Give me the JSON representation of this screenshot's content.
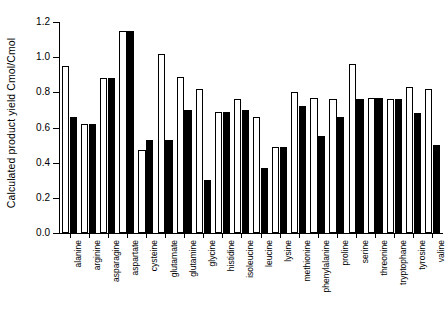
{
  "chart_data": {
    "type": "bar",
    "title": "",
    "xlabel": "",
    "ylabel": "Calculated product yield Cmol/Cmol",
    "ylim": [
      0.0,
      1.2
    ],
    "ytick_labels": [
      "0.0",
      "0.2",
      "0.4",
      "0.6",
      "0.8",
      "1.0",
      "1.2"
    ],
    "ytick_values": [
      0.0,
      0.2,
      0.4,
      0.6,
      0.8,
      1.0,
      1.2
    ],
    "grid": false,
    "legend": "none",
    "categories": [
      "alanine",
      "arginine",
      "asparagine",
      "aspartate",
      "cysteine",
      "glutamate",
      "glutamine",
      "glycine",
      "histidine",
      "isoleucine",
      "leucine",
      "lysine",
      "methionine",
      "phenylalanine",
      "proline",
      "serine",
      "threonine",
      "tryptophane",
      "tyrosine",
      "valine"
    ],
    "series": [
      {
        "name": "open",
        "style": "white-filled-black-outline",
        "values": [
          0.95,
          0.62,
          0.88,
          1.15,
          0.47,
          1.02,
          0.89,
          0.82,
          0.69,
          0.76,
          0.66,
          0.49,
          0.8,
          0.77,
          0.76,
          0.96,
          0.77,
          0.76,
          0.83,
          0.82
        ]
      },
      {
        "name": "filled",
        "style": "black",
        "values": [
          0.66,
          0.62,
          0.88,
          1.15,
          0.53,
          0.53,
          0.7,
          0.3,
          0.69,
          0.7,
          0.37,
          0.49,
          0.72,
          0.55,
          0.66,
          0.76,
          0.77,
          0.76,
          0.68,
          0.5
        ]
      }
    ]
  },
  "axes": {
    "y_axis_title": "Calculated product yield Cmol/Cmol"
  }
}
